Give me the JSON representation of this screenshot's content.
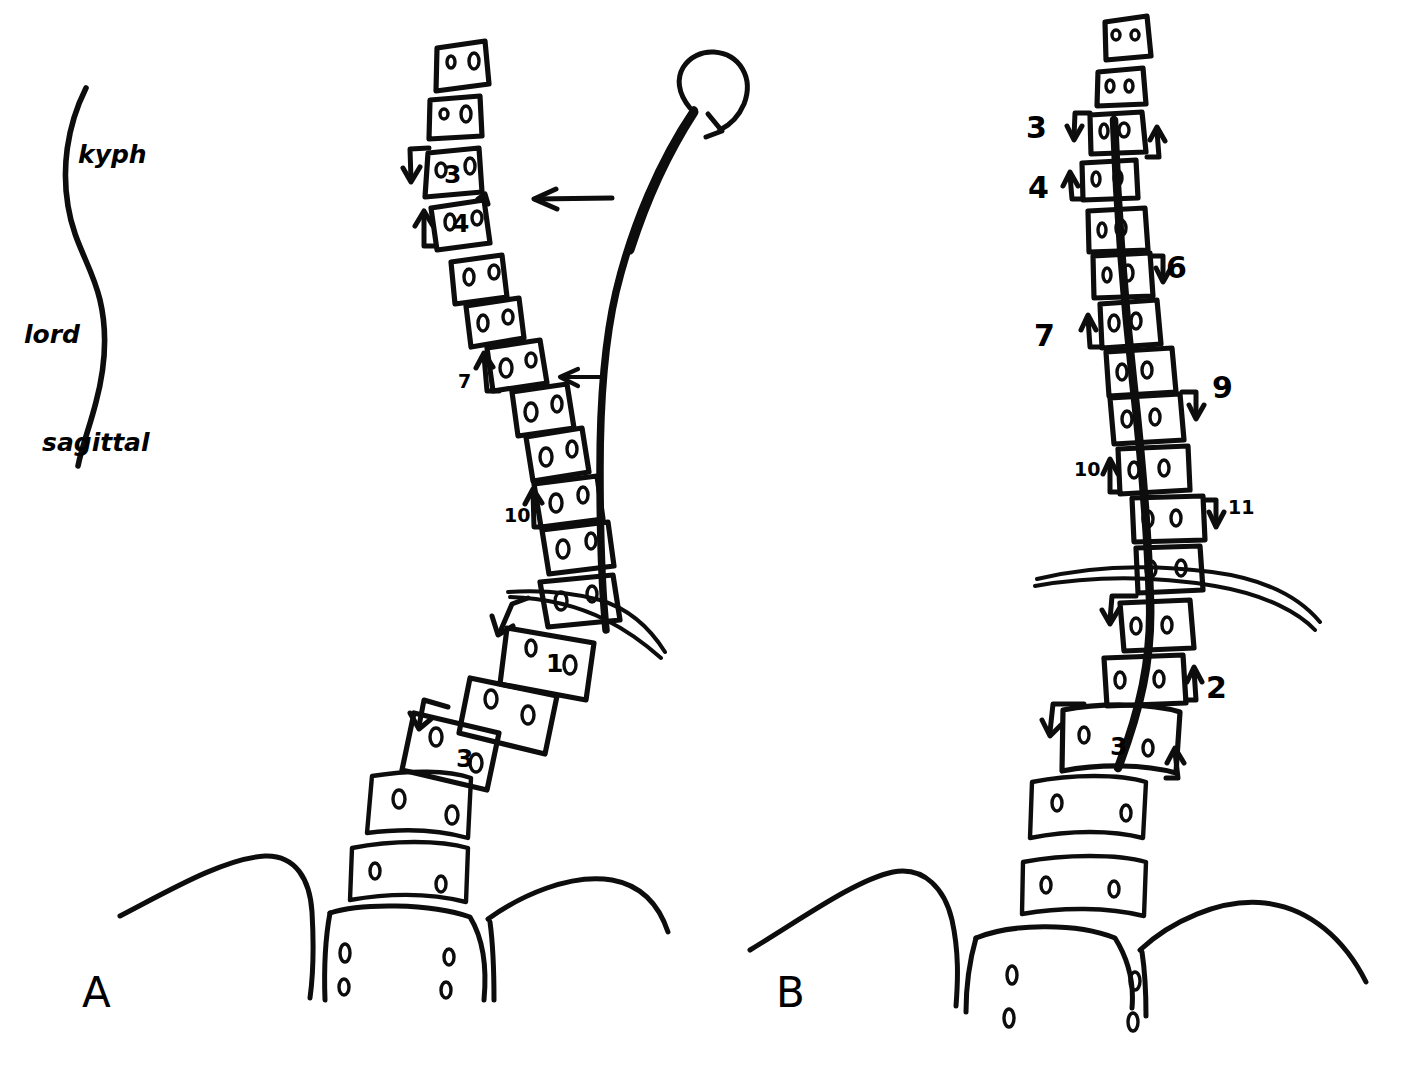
{
  "figure": {
    "type": "hand-drawn-medical-diagram",
    "background_color": "#ffffff",
    "ink_color": "#0d0d0d"
  },
  "legend": {
    "name": "sagittal-curve-key",
    "kyphosis_label": "kyph",
    "lordosis_label": "lord",
    "plane_label": "sagittal"
  },
  "panels": [
    {
      "id": "A",
      "label": "A",
      "description": "sagittal view with plumb line and rotational arrow",
      "plumb_line": true,
      "rotation_arrow": true,
      "horizontal_arrows": 2,
      "vertebra_inner_numbers": [
        "3",
        "4",
        "1",
        "3"
      ],
      "side_annotations": [
        "7",
        "10"
      ]
    },
    {
      "id": "B",
      "label": "B",
      "description": "coronal view with vertical plumb line and segmental level numbering",
      "plumb_line": true,
      "rotation_arrow": false,
      "vertebra_inner_numbers": [
        "3"
      ],
      "side_annotations": [
        "3",
        "4",
        "6",
        "7",
        "9",
        "10",
        "11",
        "2"
      ]
    }
  ],
  "annotations_A": [
    {
      "text": "7",
      "x": 463,
      "y": 385
    },
    {
      "text": "10",
      "x": 510,
      "y": 518
    }
  ],
  "annotations_B": [
    {
      "text": "3",
      "x": 1032,
      "y": 129
    },
    {
      "text": "4",
      "x": 1034,
      "y": 190
    },
    {
      "text": "6",
      "x": 1168,
      "y": 271
    },
    {
      "text": "7",
      "x": 1038,
      "y": 338
    },
    {
      "text": "9",
      "x": 1216,
      "y": 391
    },
    {
      "text": "10",
      "x": 1080,
      "y": 478
    },
    {
      "text": "11",
      "x": 1232,
      "y": 515
    },
    {
      "text": "2",
      "x": 1212,
      "y": 690
    }
  ],
  "vertebra_labels_A": [
    {
      "text": "3",
      "x": 452,
      "y": 175
    },
    {
      "text": "4",
      "x": 459,
      "y": 225
    },
    {
      "text": "1",
      "x": 554,
      "y": 666
    },
    {
      "text": "3",
      "x": 464,
      "y": 761
    }
  ],
  "vertebra_labels_B": [
    {
      "text": "3",
      "x": 1119,
      "y": 750
    }
  ],
  "panel_labels": {
    "a": {
      "text": "A",
      "x": 86,
      "y": 1000
    },
    "b": {
      "text": "B",
      "x": 780,
      "y": 1000
    }
  },
  "sacrum": {
    "foramina_count_per_side": 2,
    "sides": 2
  }
}
